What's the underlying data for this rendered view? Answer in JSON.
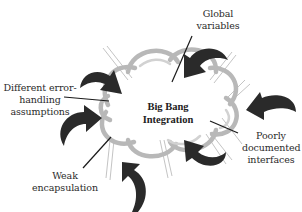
{
  "diagram": {
    "center": {
      "line1": "Big Bang",
      "line2": "Integration"
    },
    "labels": [
      {
        "id": "global-variables",
        "line1": "Global",
        "line2": "variables",
        "line3": ""
      },
      {
        "id": "different-error-handling",
        "line1": "Different error-",
        "line2": "handling",
        "line3": "assumptions"
      },
      {
        "id": "poorly-documented-interfaces",
        "line1": "Poorly",
        "line2": "documented",
        "line3": "interfaces"
      },
      {
        "id": "weak-encapsulation",
        "line1": "Weak",
        "line2": "encapsulation",
        "line3": ""
      }
    ],
    "colors": {
      "background": "#ffffff",
      "cloud_outline": "#b8b8b8",
      "arrow_fill": "#2a2a2a",
      "leader_line": "#1a1a1a",
      "text": "#2b2b2b"
    }
  }
}
